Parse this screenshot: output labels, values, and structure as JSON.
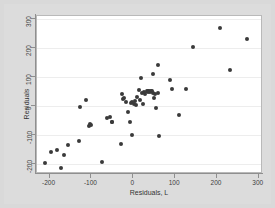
{
  "chart_data": {
    "type": "scatter",
    "title": "",
    "xlabel": "Residuals, L",
    "ylabel": "Residuals",
    "xlim": [
      -230,
      310
    ],
    "ylim": [
      -235,
      310
    ],
    "xticks": [
      -200,
      -100,
      0,
      100,
      200,
      300
    ],
    "yticks": [
      -200,
      -100,
      0,
      100,
      200,
      300
    ],
    "xtick_labels": [
      "-200",
      "-100",
      "0",
      "100",
      "200",
      "300"
    ],
    "ytick_labels": [
      "-200",
      "-100",
      "0",
      "100",
      "200",
      "300"
    ],
    "grid": "horizontal",
    "legend": "none",
    "marker_color": "#3a3a3a",
    "plot_background": "#ffffff",
    "figure_background": "#dcdcdc",
    "points": [
      [
        -212,
        -198
      ],
      [
        -196,
        -158
      ],
      [
        -182,
        -152
      ],
      [
        -172,
        -215
      ],
      [
        -166,
        -170
      ],
      [
        -156,
        -135
      ],
      [
        -130,
        -122
      ],
      [
        -128,
        -4
      ],
      [
        -112,
        22
      ],
      [
        -106,
        -70
      ],
      [
        -104,
        -64
      ],
      [
        -102,
        -66
      ],
      [
        -76,
        -194
      ],
      [
        -62,
        -42
      ],
      [
        -56,
        -38
      ],
      [
        -52,
        -56
      ],
      [
        -50,
        -56
      ],
      [
        -30,
        -132
      ],
      [
        -26,
        42
      ],
      [
        -24,
        25
      ],
      [
        -22,
        28
      ],
      [
        -18,
        12
      ],
      [
        -12,
        -20
      ],
      [
        -8,
        -56
      ],
      [
        -6,
        10
      ],
      [
        -4,
        -102
      ],
      [
        -2,
        14
      ],
      [
        2,
        8
      ],
      [
        4,
        18
      ],
      [
        6,
        2
      ],
      [
        10,
        30
      ],
      [
        14,
        56
      ],
      [
        16,
        20
      ],
      [
        18,
        96
      ],
      [
        20,
        44
      ],
      [
        22,
        6
      ],
      [
        26,
        48
      ],
      [
        28,
        40
      ],
      [
        32,
        52
      ],
      [
        34,
        48
      ],
      [
        36,
        50
      ],
      [
        38,
        50
      ],
      [
        40,
        48
      ],
      [
        42,
        50
      ],
      [
        44,
        52
      ],
      [
        46,
        46
      ],
      [
        48,
        110
      ],
      [
        50,
        28
      ],
      [
        52,
        42
      ],
      [
        54,
        -8
      ],
      [
        58,
        140
      ],
      [
        60,
        46
      ],
      [
        62,
        -104
      ],
      [
        88,
        88
      ],
      [
        92,
        58
      ],
      [
        110,
        -32
      ],
      [
        126,
        60
      ],
      [
        142,
        204
      ],
      [
        206,
        268
      ],
      [
        232,
        124
      ],
      [
        272,
        230
      ]
    ]
  }
}
